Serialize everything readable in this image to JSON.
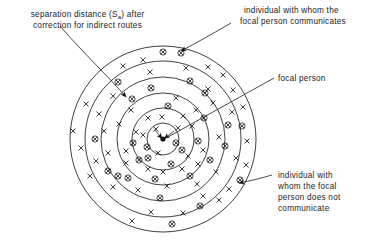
{
  "figure": {
    "type": "concentric-ring-sociogram",
    "center": {
      "x": 163,
      "y": 139
    },
    "rings": [
      15,
      29,
      42,
      56,
      72,
      93
    ],
    "ring_count": 6,
    "annotations": [
      {
        "id": "separation-distance",
        "line1": "separation distance (S",
        "sub": "a",
        "line1_tail": ") after",
        "line2": "correction for indirect routes",
        "x": 8,
        "y": 13,
        "leader": {
          "from": [
            62,
            27
          ],
          "to": [
            126,
            98
          ]
        }
      },
      {
        "id": "communicates",
        "line1": "individual with whom the",
        "line2": "focal person communicates",
        "x": 218,
        "y": 12,
        "leader": {
          "from": [
            232,
            22
          ],
          "to": [
            180,
            52
          ]
        }
      },
      {
        "id": "focal-person",
        "line1": "focal person",
        "x": 277,
        "y": 80,
        "leader": {
          "from": [
            273,
            78
          ],
          "to": [
            168,
            137
          ]
        }
      },
      {
        "id": "does-not-communicate",
        "line1": "individual with",
        "line2": "whom the focal",
        "line3": "person does not",
        "line4": "communicate",
        "x": 277,
        "y": 176,
        "leader": {
          "from": [
            272,
            174
          ],
          "to": [
            238,
            183
          ]
        }
      }
    ],
    "legend": {
      "focal_symbol": "filled-dot",
      "communicating_symbol": "circled-x",
      "non_communicating_symbol": "plain-x"
    },
    "symbols": {
      "circled_x": [
        [
          163,
          52
        ],
        [
          181,
          52
        ],
        [
          118,
          82
        ],
        [
          190,
          81
        ],
        [
          151,
          88
        ],
        [
          205,
          93
        ],
        [
          131,
          104
        ],
        [
          168,
          106
        ],
        [
          228,
          125
        ],
        [
          204,
          118
        ],
        [
          95,
          139
        ],
        [
          133,
          143
        ],
        [
          242,
          126
        ],
        [
          147,
          146
        ],
        [
          176,
          143
        ],
        [
          198,
          141
        ],
        [
          225,
          146
        ],
        [
          139,
          160
        ],
        [
          171,
          164
        ],
        [
          210,
          160
        ],
        [
          108,
          171
        ],
        [
          117,
          176
        ],
        [
          128,
          178
        ],
        [
          155,
          179
        ],
        [
          190,
          176
        ],
        [
          240,
          180
        ],
        [
          160,
          198
        ],
        [
          200,
          206
        ],
        [
          172,
          224
        ]
      ],
      "plain_x": [
        [
          123,
          66
        ],
        [
          143,
          60
        ],
        [
          208,
          67
        ],
        [
          223,
          75
        ],
        [
          150,
          72
        ],
        [
          186,
          68
        ],
        [
          233,
          90
        ],
        [
          86,
          104
        ],
        [
          99,
          114
        ],
        [
          113,
          96
        ],
        [
          243,
          107
        ],
        [
          73,
          131
        ],
        [
          81,
          148
        ],
        [
          104,
          131
        ],
        [
          119,
          124
        ],
        [
          148,
          118
        ],
        [
          162,
          117
        ],
        [
          183,
          116
        ],
        [
          196,
          110
        ],
        [
          213,
          103
        ],
        [
          232,
          112
        ],
        [
          247,
          141
        ],
        [
          156,
          129
        ],
        [
          178,
          128
        ],
        [
          192,
          126
        ],
        [
          136,
          132
        ],
        [
          126,
          151
        ],
        [
          143,
          135
        ],
        [
          158,
          153
        ],
        [
          188,
          156
        ],
        [
          203,
          150
        ],
        [
          219,
          137
        ],
        [
          236,
          158
        ],
        [
          148,
          169
        ],
        [
          163,
          172
        ],
        [
          182,
          169
        ],
        [
          126,
          163
        ],
        [
          96,
          161
        ],
        [
          113,
          187
        ],
        [
          138,
          190
        ],
        [
          167,
          186
        ],
        [
          197,
          184
        ],
        [
          216,
          172
        ],
        [
          229,
          189
        ],
        [
          151,
          212
        ],
        [
          183,
          213
        ],
        [
          132,
          221
        ],
        [
          203,
          196
        ],
        [
          90,
          176
        ],
        [
          108,
          153
        ],
        [
          246,
          165
        ],
        [
          198,
          164
        ]
      ]
    }
  }
}
